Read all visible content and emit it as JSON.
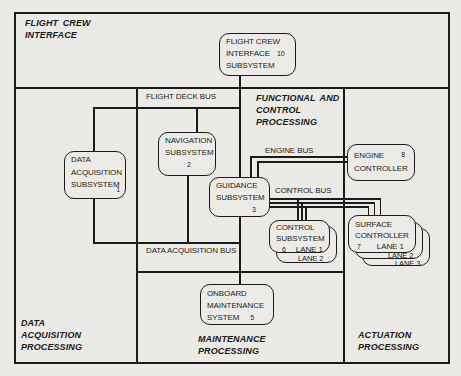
{
  "regions": {
    "flight_crew_interface": {
      "lines": [
        "FLIGHT CREW",
        "INTERFACE"
      ]
    },
    "functional_and_control_processing": {
      "lines": [
        "FUNCTIONAL AND",
        "CONTROL",
        "PROCESSING"
      ]
    },
    "data_acquisition_processing": {
      "lines": [
        "DATA",
        "ACQUISITION",
        "PROCESSING"
      ]
    },
    "maintenance_processing": {
      "lines": [
        "MAINTENANCE",
        "PROCESSING"
      ]
    },
    "actuation_processing": {
      "lines": [
        "ACTUATION",
        "PROCESSING"
      ]
    }
  },
  "buses": {
    "flight_deck_bus": {
      "label": "FLIGHT DECK BUS"
    },
    "data_acquisition_bus": {
      "label": "DATA ACQUISITION BUS"
    },
    "engine_bus": {
      "label": "ENGINE BUS"
    },
    "control_bus": {
      "label": "CONTROL BUS"
    }
  },
  "nodes": {
    "flight_crew_interface_subsystem": {
      "lines": [
        "FLIGHT CREW",
        "INTERFACE",
        "SUBSYSTEM"
      ],
      "number": "10"
    },
    "data_acquisition_subsystem": {
      "lines": [
        "DATA",
        "ACQUISITION",
        "SUBSYSTEM"
      ],
      "number": "1"
    },
    "navigation_subsystem": {
      "lines": [
        "NAVIGATION",
        "SUBSYSTEM"
      ],
      "number": "2"
    },
    "guidance_subsystem": {
      "lines": [
        "GUIDANCE",
        "SUBSYSTEM"
      ],
      "number": "3"
    },
    "onboard_maintenance_system": {
      "lines": [
        "ONBOARD",
        "MAINTENANCE",
        "SYSTEM"
      ],
      "number": "5"
    },
    "control_subsystem": {
      "lines": [
        "CONTROL",
        "SUBSYSTEM"
      ],
      "number": "6",
      "lane": "LANE 1",
      "stacked_lanes": [
        "LANE 2"
      ]
    },
    "surface_controller": {
      "lines": [
        "SURFACE",
        "CONTROLLER"
      ],
      "number": "7",
      "lane": "LANE 1",
      "stacked_lanes": [
        "LANE 2",
        "LANE 3"
      ]
    },
    "engine_controller": {
      "lines": [
        "ENGINE",
        "CONTROLLER"
      ],
      "number": "8"
    }
  },
  "colors": {
    "line": "#1b1b1b",
    "paper": "#eceae6",
    "box_fill": "#edebe7"
  }
}
